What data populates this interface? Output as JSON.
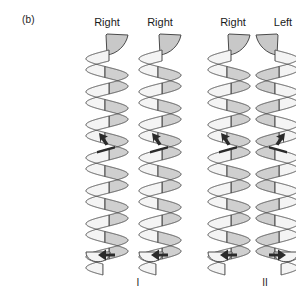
{
  "figure": {
    "panel_label": "(b)",
    "domain_kind": "diagram"
  },
  "column_labels": [
    {
      "name": "helix-1-handedness",
      "text": "Right",
      "center_x": 107,
      "group": "I"
    },
    {
      "name": "helix-2-handedness",
      "text": "Right",
      "center_x": 160,
      "group": "I"
    },
    {
      "name": "helix-3-handedness",
      "text": "Right",
      "center_x": 233,
      "group": "II"
    },
    {
      "name": "helix-4-handedness",
      "text": "Left",
      "center_x": 283,
      "group": "II"
    }
  ],
  "group_labels": [
    {
      "name": "group-label-I",
      "text": "I",
      "center_x": 138
    },
    {
      "name": "group-label-II",
      "text": "II",
      "center_x": 265
    }
  ],
  "helices": [
    {
      "id": "I-a",
      "handedness": "Right",
      "group": "I",
      "mirrored": false,
      "arrow_mid": "up-left",
      "arrow_bottom": "left"
    },
    {
      "id": "I-b",
      "handedness": "Right",
      "group": "I",
      "mirrored": false,
      "arrow_mid": "up-left",
      "arrow_bottom": "left"
    },
    {
      "id": "II-a",
      "handedness": "Right",
      "group": "II",
      "mirrored": false,
      "arrow_mid": "up-left",
      "arrow_bottom": "left"
    },
    {
      "id": "II-b",
      "handedness": "Left",
      "group": "II",
      "mirrored": true,
      "arrow_mid": "up-right",
      "arrow_bottom": "right"
    }
  ],
  "colors": {
    "background": "#ffffff",
    "outline": "#4a4a4a",
    "ribbon_front": "#f4f4f4",
    "ribbon_back": "#cfcfcf",
    "ribbon_cap": "#c8c8c8",
    "arrow": "#2b2b2b",
    "text": "#1a1a1a"
  },
  "geometry": {
    "helix_top_y": 34,
    "helix_bottom_y": 268,
    "turns": 7,
    "ribbon_half_width": 21,
    "pitch": 33,
    "mid_arrow_y": 140,
    "bottom_arrow_y": 255
  }
}
